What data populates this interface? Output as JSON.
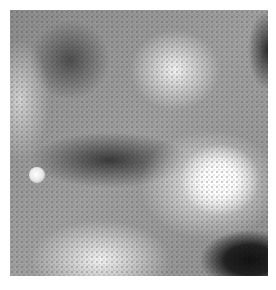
{
  "image": {
    "type": "grayscale-micrograph",
    "description": "Textured grayscale surface with hexagonal dot pattern, bright regions and dark regions, a small bright particle on the left",
    "colors": {
      "background": "#ffffff",
      "bright": "#ffffff",
      "mid": "#9a9a9a",
      "dark": "#111111"
    }
  }
}
